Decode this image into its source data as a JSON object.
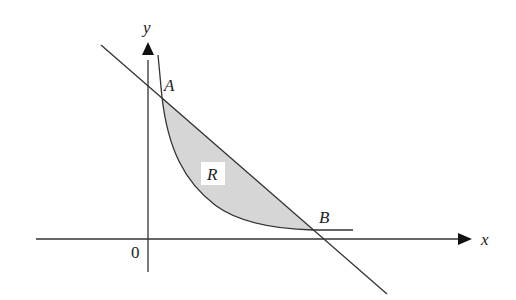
{
  "diagram": {
    "type": "region-between-line-and-curve",
    "axes": {
      "x_label": "x",
      "y_label": "y",
      "origin_label": "0"
    },
    "points": [
      {
        "name": "A",
        "label": "A"
      },
      {
        "name": "B",
        "label": "B"
      }
    ],
    "region": {
      "label": "R",
      "fill": "#d6d6d6"
    },
    "colors": {
      "stroke": "#333333",
      "region_fill": "#d6d6d6",
      "background": "#ffffff"
    }
  }
}
